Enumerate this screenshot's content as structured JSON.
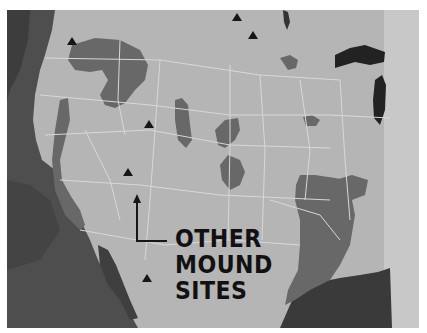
{
  "map": {
    "title": "Other mound sites map",
    "style": "grayscale photograph of museum panel",
    "colors": {
      "land": "#b7b7b7",
      "ocean": "#5a5a5a",
      "mound_regions": "#6a6a6a",
      "borders": "#d6d6d6",
      "lakes": "#2a2a2a",
      "markers": "#1a1a1a",
      "text": "#111111"
    },
    "label": {
      "lines": [
        "OTHER",
        "MOUND",
        "SITES"
      ]
    },
    "markers": [
      {
        "name": "site-pacific-northwest",
        "x": 72,
        "y": 41
      },
      {
        "name": "site-north-central-1",
        "x": 237,
        "y": 17
      },
      {
        "name": "site-north-central-2",
        "x": 253,
        "y": 35
      },
      {
        "name": "site-great-basin",
        "x": 149,
        "y": 124
      },
      {
        "name": "site-southwest",
        "x": 128,
        "y": 172
      },
      {
        "name": "site-mexico",
        "x": 147,
        "y": 278
      }
    ],
    "caption": "(partially cut-off caption text, illegible)"
  }
}
